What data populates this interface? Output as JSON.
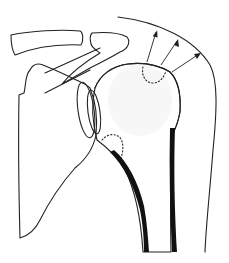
{
  "figure": {
    "title": "",
    "structures": [
      "clavicle",
      "acromion",
      "coracoid-process",
      "scapula-body",
      "glenoid",
      "humeral-head",
      "humeral-shaft",
      "soft-tissue-outline"
    ],
    "annotations": {
      "arrows": 3,
      "dotted_regions": 2
    },
    "colors": {
      "bone_fill": "#dcdcdc",
      "line": "#222222",
      "cortex": "#111111",
      "background": "#ffffff"
    }
  }
}
